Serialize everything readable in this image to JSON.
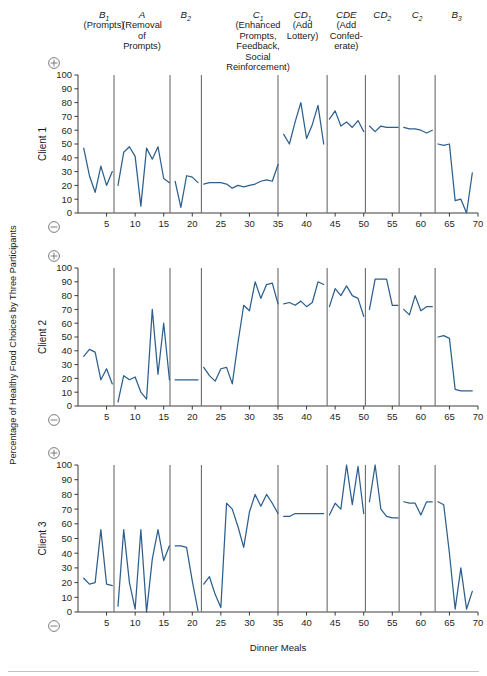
{
  "figure": {
    "y_axis_title": "Percentage of Healthy Food Choices by Three Participants",
    "x_axis_title": "Dinner Meals",
    "plus_symbol": "⊕",
    "minus_symbol": "⊖"
  },
  "phase_labels": [
    {
      "id": "B1",
      "main": "B",
      "sub": "1",
      "desc": [
        "(Prompts)"
      ]
    },
    {
      "id": "A",
      "main": "A",
      "sub": "",
      "desc": [
        "(Removal",
        "of",
        "Prompts)"
      ]
    },
    {
      "id": "B2",
      "main": "B",
      "sub": "2",
      "desc": []
    },
    {
      "id": "C1",
      "main": "C",
      "sub": "1",
      "desc": [
        "(Enhanced",
        "Prompts,",
        "Feedback,",
        "Social",
        "Reinforcement)"
      ]
    },
    {
      "id": "CD1",
      "main": "CD",
      "sub": "1",
      "desc": [
        "(Add",
        "Lottery)"
      ]
    },
    {
      "id": "CDE",
      "main": "CDE",
      "sub": "",
      "desc": [
        "(Add",
        "Confed-",
        "erate)"
      ]
    },
    {
      "id": "CD2",
      "main": "CD",
      "sub": "2",
      "desc": []
    },
    {
      "id": "C2",
      "main": "C",
      "sub": "2",
      "desc": []
    },
    {
      "id": "B3",
      "main": "B",
      "sub": "3",
      "desc": []
    }
  ],
  "chart_data": {
    "type": "line",
    "title": "",
    "xlabel": "Dinner Meals",
    "ylabel": "Percentage of Healthy Food Choices by Three Participants",
    "xlim": [
      0,
      70
    ],
    "ylim": [
      0,
      100
    ],
    "xticks": [
      5,
      10,
      15,
      20,
      25,
      30,
      35,
      40,
      45,
      50,
      55,
      60,
      65,
      70
    ],
    "yticks": [
      0,
      10,
      20,
      30,
      40,
      50,
      60,
      70,
      80,
      90,
      100
    ],
    "grid": false,
    "legend": "none",
    "line_color": "#2d5f8e",
    "phase_dividers": [
      6.3,
      16.1,
      21.6,
      35.0,
      43.6,
      50.3,
      56.2,
      62.5
    ],
    "phase_spans": [
      {
        "label": "B1",
        "from": 1,
        "to": 6.3
      },
      {
        "label": "A",
        "from": 6.3,
        "to": 16.1
      },
      {
        "label": "B2",
        "from": 16.1,
        "to": 21.6
      },
      {
        "label": "C1",
        "from": 21.6,
        "to": 35.0
      },
      {
        "label": "CD1",
        "from": 35.0,
        "to": 43.6
      },
      {
        "label": "CDE",
        "from": 43.6,
        "to": 50.3
      },
      {
        "label": "CD2",
        "from": 50.3,
        "to": 56.2
      },
      {
        "label": "C2",
        "from": 56.2,
        "to": 62.5
      },
      {
        "label": "B3",
        "from": 62.5,
        "to": 70
      }
    ],
    "series": [
      {
        "name": "Client 1",
        "segments": [
          {
            "phase": "B1",
            "x": [
              1,
              2,
              3,
              4,
              5,
              6
            ],
            "y": [
              47,
              27,
              15,
              34,
              20,
              30
            ]
          },
          {
            "phase": "A",
            "x": [
              7,
              8,
              9,
              10,
              11,
              12,
              13,
              14,
              15,
              16
            ],
            "y": [
              20,
              44,
              48,
              41,
              5,
              47,
              39,
              48,
              25,
              22
            ]
          },
          {
            "phase": "B2",
            "x": [
              17,
              18,
              19,
              20,
              21
            ],
            "y": [
              23,
              4,
              27,
              26,
              22
            ]
          },
          {
            "phase": "C1",
            "x": [
              22,
              23,
              24,
              25,
              26,
              27,
              28,
              29,
              30,
              31,
              32,
              33,
              34,
              35
            ],
            "y": [
              21,
              22,
              22,
              22,
              21,
              18,
              20,
              19,
              20,
              21,
              23,
              24,
              23,
              35
            ]
          },
          {
            "phase": "CD1",
            "x": [
              36,
              37,
              38,
              39,
              40,
              41,
              42,
              43
            ],
            "y": [
              57,
              50,
              66,
              80,
              54,
              64,
              78,
              50
            ]
          },
          {
            "phase": "CDE",
            "x": [
              44,
              45,
              46,
              47,
              48,
              49,
              50
            ],
            "y": [
              68,
              74,
              63,
              66,
              62,
              67,
              59
            ]
          },
          {
            "phase": "CD2",
            "x": [
              51,
              52,
              53,
              54,
              55,
              56
            ],
            "y": [
              63,
              59,
              63,
              62,
              62,
              62
            ]
          },
          {
            "phase": "C2",
            "x": [
              57,
              58,
              59,
              60,
              61,
              62
            ],
            "y": [
              62,
              61,
              61,
              60,
              58,
              60
            ]
          },
          {
            "phase": "B3",
            "x": [
              63,
              64,
              65,
              66,
              67,
              68,
              69
            ],
            "y": [
              50,
              49,
              50,
              9,
              10,
              0,
              29
            ]
          }
        ]
      },
      {
        "name": "Client 2",
        "segments": [
          {
            "phase": "B1",
            "x": [
              1,
              2,
              3,
              4,
              5,
              6
            ],
            "y": [
              36,
              41,
              39,
              19,
              27,
              16
            ]
          },
          {
            "phase": "A",
            "x": [
              7,
              8,
              9,
              10,
              11,
              12,
              13,
              14,
              15,
              16
            ],
            "y": [
              3,
              22,
              19,
              21,
              10,
              5,
              70,
              23,
              60,
              19
            ]
          },
          {
            "phase": "B2",
            "x": [
              17,
              18,
              19,
              20,
              21
            ],
            "y": [
              19,
              19,
              19,
              19,
              19
            ]
          },
          {
            "phase": "C1",
            "x": [
              22,
              23,
              24,
              25,
              26,
              27,
              28,
              29,
              30,
              31,
              32,
              33,
              34,
              35
            ],
            "y": [
              28,
              22,
              18,
              27,
              28,
              16,
              46,
              73,
              69,
              90,
              78,
              88,
              89,
              74
            ]
          },
          {
            "phase": "CD1",
            "x": [
              36,
              37,
              38,
              39,
              40,
              41,
              42,
              43
            ],
            "y": [
              74,
              75,
              73,
              76,
              72,
              75,
              90,
              88
            ]
          },
          {
            "phase": "CDE",
            "x": [
              44,
              45,
              46,
              47,
              48,
              49,
              50
            ],
            "y": [
              72,
              85,
              80,
              87,
              80,
              78,
              65
            ]
          },
          {
            "phase": "CD2",
            "x": [
              51,
              52,
              53,
              54,
              55,
              56
            ],
            "y": [
              70,
              92,
              92,
              92,
              73,
              73
            ]
          },
          {
            "phase": "C2",
            "x": [
              57,
              58,
              59,
              60,
              61,
              62
            ],
            "y": [
              70,
              66,
              80,
              69,
              72,
              72
            ]
          },
          {
            "phase": "B3",
            "x": [
              63,
              64,
              65,
              66,
              67,
              68,
              69
            ],
            "y": [
              50,
              51,
              49,
              12,
              11,
              11,
              11
            ]
          }
        ]
      },
      {
        "name": "Client 3",
        "segments": [
          {
            "phase": "B1",
            "x": [
              1,
              2,
              3,
              4,
              5,
              6
            ],
            "y": [
              23,
              19,
              20,
              56,
              19,
              18
            ]
          },
          {
            "phase": "A",
            "x": [
              7,
              8,
              9,
              10,
              11,
              12,
              13,
              14,
              15,
              16
            ],
            "y": [
              4,
              56,
              20,
              2,
              56,
              0,
              36,
              56,
              35,
              45
            ]
          },
          {
            "phase": "B2",
            "x": [
              17,
              18,
              19,
              20,
              21
            ],
            "y": [
              45,
              45,
              44,
              21,
              1
            ]
          },
          {
            "phase": "C1",
            "x": [
              22,
              23,
              24,
              25,
              26,
              27,
              28,
              29,
              30,
              31,
              32,
              33,
              34,
              35
            ],
            "y": [
              19,
              24,
              12,
              3,
              74,
              70,
              58,
              44,
              68,
              80,
              72,
              80,
              74,
              67
            ]
          },
          {
            "phase": "CD1",
            "x": [
              36,
              37,
              38,
              39,
              40,
              41,
              42,
              43
            ],
            "y": [
              65,
              65,
              67,
              67,
              67,
              67,
              67,
              67
            ]
          },
          {
            "phase": "CDE",
            "x": [
              44,
              45,
              46,
              47,
              48,
              49,
              50
            ],
            "y": [
              66,
              74,
              70,
              100,
              73,
              99,
              67
            ]
          },
          {
            "phase": "CD2",
            "x": [
              51,
              52,
              53,
              54,
              55,
              56
            ],
            "y": [
              75,
              100,
              70,
              65,
              64,
              64
            ]
          },
          {
            "phase": "C2",
            "x": [
              57,
              58,
              59,
              60,
              61,
              62
            ],
            "y": [
              75,
              74,
              74,
              66,
              75,
              75
            ]
          },
          {
            "phase": "B3",
            "x": [
              63,
              64,
              65,
              66,
              67,
              68,
              69
            ],
            "y": [
              75,
              73,
              40,
              2,
              30,
              2,
              14
            ]
          }
        ]
      }
    ]
  }
}
